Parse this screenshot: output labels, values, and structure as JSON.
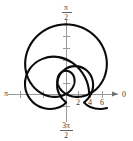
{
  "figure": {
    "title": "",
    "background_color": "#ffffff",
    "width": 133,
    "height": 141
  },
  "axes": {
    "origin_x": 66,
    "origin_y": 94,
    "unit_px": 11.6,
    "horizontal_axis_name": "polar-axis-horizontal",
    "vertical_axis_name": "polar-axis-vertical",
    "axis_color": "#9a9a9a"
  },
  "angle_labels": {
    "right": "0",
    "left": "π",
    "top_numerator": "π",
    "top_denominator": "2",
    "bottom_numerator": "3π",
    "bottom_denominator": "2"
  },
  "radial_tick_labels": [
    "2",
    "4",
    "6"
  ],
  "radial_tick_values": [
    2,
    4,
    6
  ],
  "chart_data": {
    "type": "line",
    "plot_kind": "polar",
    "title": "",
    "subtitle": "",
    "xlabel": "",
    "ylabel": "",
    "grid": false,
    "legend": null,
    "legend_position": "none",
    "equation": "r = 2 + 4 sin(theta)",
    "curve_name": "limacon-with-inner-loop",
    "curve_color": "#0b0b0b",
    "curve_width": 2.1,
    "theta_range_deg": [
      0,
      360
    ],
    "r_max": 6,
    "r_min": -2,
    "xlim": [
      -8,
      8
    ],
    "ylim": [
      -2,
      6
    ],
    "angle_tick_labels": [
      "0",
      "π/2",
      "π",
      "3π/2"
    ],
    "angle_tick_values_deg": [
      0,
      90,
      180,
      270
    ],
    "radial_ticks": [
      2,
      4,
      6
    ],
    "annotations": [],
    "outer_loop": {
      "description": "large outer loop reaching r = 6 at theta = 90 degrees",
      "max_radius": 6,
      "max_radius_angle_deg": 90
    },
    "inner_loop": {
      "description": "inner loop traced for sin(theta) < -0.5, tangent at the pole",
      "max_radius": 2,
      "max_radius_angle_deg": 270
    },
    "series": [
      {
        "name": "r = 2 + 4 sin(theta)",
        "theta_deg": [
          0,
          15,
          30,
          45,
          60,
          75,
          90,
          105,
          120,
          135,
          150,
          165,
          180,
          195,
          210,
          225,
          240,
          255,
          270,
          285,
          300,
          315,
          330,
          345,
          360
        ],
        "r": [
          2.0,
          3.04,
          4.0,
          4.83,
          5.46,
          5.86,
          6.0,
          5.86,
          5.46,
          4.83,
          4.0,
          3.04,
          2.0,
          0.96,
          0.0,
          -0.83,
          -1.46,
          -1.86,
          -2.0,
          -1.86,
          -1.46,
          -0.83,
          0.0,
          0.96,
          2.0
        ]
      }
    ]
  }
}
